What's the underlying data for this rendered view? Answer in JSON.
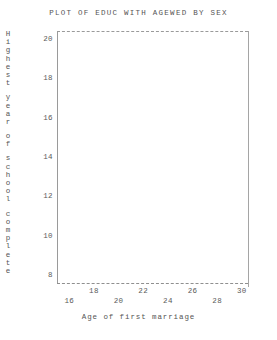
{
  "chart_data": {
    "type": "scatter",
    "title": "PLOT OF EDUC WITH AGEWED BY SEX",
    "xlabel": "Age of first marriage",
    "ylabel": "Highest year of school complete",
    "x": [],
    "y": [],
    "series": [],
    "xlim": [
      15,
      30.5
    ],
    "ylim": [
      7.6,
      20.4
    ],
    "xticks": [
      16,
      18,
      20,
      22,
      24,
      26,
      28,
      30
    ],
    "yticks": [
      8,
      10,
      12,
      14,
      16,
      18,
      20
    ],
    "xtick_labels": [
      "16",
      "18",
      "20",
      "22",
      "24",
      "26",
      "28",
      "30"
    ],
    "ytick_labels": [
      "8",
      "10",
      "12",
      "14",
      "16",
      "18",
      "20"
    ],
    "xtick_label_rows": [
      "lower",
      "upper",
      "lower",
      "upper",
      "lower",
      "upper",
      "lower",
      "upper"
    ],
    "grid": false,
    "legend": null,
    "annotations": [],
    "note": "Plot area is empty; no plotted data markers are visible."
  },
  "axes": {
    "title": "PLOT OF EDUC WITH AGEWED BY SEX",
    "x_title": "Age of first marriage",
    "y_title_chars": [
      "H",
      "i",
      "g",
      "h",
      "e",
      "s",
      "t",
      "",
      "y",
      "e",
      "a",
      "r",
      "",
      "o",
      "f",
      "",
      "s",
      "c",
      "h",
      "o",
      "o",
      "l",
      "",
      "c",
      "o",
      "m",
      "p",
      "l",
      "e",
      "t",
      "e"
    ],
    "y_ticks": [
      {
        "label": "20",
        "value": 20
      },
      {
        "label": "18",
        "value": 18
      },
      {
        "label": "16",
        "value": 16
      },
      {
        "label": "14",
        "value": 14
      },
      {
        "label": "12",
        "value": 12
      },
      {
        "label": "10",
        "value": 10
      },
      {
        "label": "8",
        "value": 8
      }
    ],
    "x_ticks": [
      {
        "label": "16",
        "value": 16,
        "row": "lower"
      },
      {
        "label": "18",
        "value": 18,
        "row": "upper"
      },
      {
        "label": "20",
        "value": 20,
        "row": "lower"
      },
      {
        "label": "22",
        "value": 22,
        "row": "upper"
      },
      {
        "label": "24",
        "value": 24,
        "row": "lower"
      },
      {
        "label": "26",
        "value": 26,
        "row": "upper"
      },
      {
        "label": "28",
        "value": 28,
        "row": "lower"
      },
      {
        "label": "30",
        "value": 30,
        "row": "upper"
      }
    ]
  },
  "colors": {
    "background": "#ffffff",
    "text": "#555555",
    "axis_line": "#9a9a9a"
  }
}
